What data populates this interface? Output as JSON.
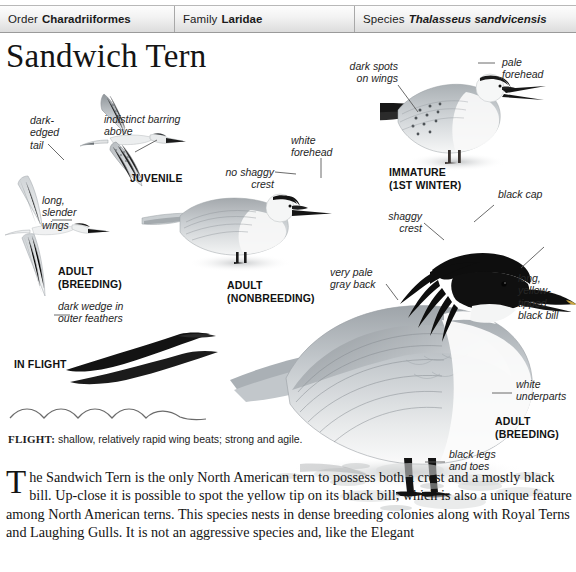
{
  "taxonomy": {
    "order_label": "Order",
    "order_value": "Charadriiformes",
    "family_label": "Family",
    "family_value": "Laridae",
    "species_label": "Species",
    "species_value": "Thalasseus sandvicensis"
  },
  "page_title": "Sandwich Tern",
  "callouts": {
    "dark_edged_tail": "dark-\nedged\ntail",
    "indistinct_barring": "indistinct barring\nabove",
    "long_slender_wings": "long,\nslender\nwings",
    "dark_wedge": "dark wedge in\nouter feathers",
    "no_shaggy_crest": "no shaggy\ncrest",
    "white_forehead": "white\nforehead",
    "dark_spots_on_wings": "dark spots\non wings",
    "pale_forehead": "pale\nforehead",
    "black_cap": "black cap",
    "shaggy_crest": "shaggy\ncrest",
    "very_pale_gray_back": "very pale\ngray back",
    "long_yellow_tipped_black_bill": "long,\nyellow-\ntipped\nblack bill",
    "white_underparts": "white\nunderparts",
    "black_legs_and_toes": "black legs\nand toes"
  },
  "captions": {
    "juvenile": "JUVENILE",
    "adult_breeding_flight": "ADULT\n(BREEDING)",
    "in_flight": "IN FLIGHT",
    "adult_nonbreeding": "ADULT\n(NONBREEDING)",
    "immature": "IMMATURE\n(1ST WINTER)",
    "adult_breeding": "ADULT\n(BREEDING)"
  },
  "flight_note": {
    "label": "FLIGHT:",
    "text": " shallow, relatively rapid wing beats; strong and agile."
  },
  "body_text": {
    "dropcap": "T",
    "paragraph": "he Sandwich Tern is the only North American tern to possess both a crest and a mostly black bill. Up-close it is possible to spot the yellow tip on its black bill, which is also a unique feature among North American terns. This species nests in dense breeding colonies along with Royal Terns and Laughing Gulls. It is not an aggressive species and, like the Elegant"
  },
  "colors": {
    "header_border": "#9a9a9a",
    "header_fill": "#e9e9e9",
    "text": "#141414",
    "leader_line": "#555555",
    "plumage_gray": "#b9bdc0",
    "plumage_black": "#1b1b1b"
  }
}
